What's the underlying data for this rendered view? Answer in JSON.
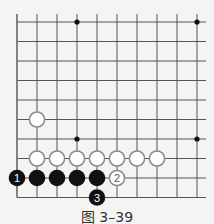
{
  "diagram": {
    "caption": "图 3–39",
    "grid": {
      "cols": 10,
      "rows": 10,
      "x0": 17,
      "dx": 20,
      "y0": 22,
      "dy": 19.5,
      "open_top": true,
      "open_right": true,
      "line_color": "#555555"
    },
    "star_points": [
      {
        "col": 3,
        "row": 0
      },
      {
        "col": 9,
        "row": 0
      },
      {
        "col": 3,
        "row": 6
      },
      {
        "col": 9,
        "row": 6
      }
    ],
    "stones": [
      {
        "color": "white",
        "col": 1,
        "row": 5,
        "label": ""
      },
      {
        "color": "white",
        "col": 1,
        "row": 7,
        "label": ""
      },
      {
        "color": "white",
        "col": 2,
        "row": 7,
        "label": ""
      },
      {
        "color": "white",
        "col": 3,
        "row": 7,
        "label": ""
      },
      {
        "color": "white",
        "col": 4,
        "row": 7,
        "label": ""
      },
      {
        "color": "white",
        "col": 5,
        "row": 7,
        "label": ""
      },
      {
        "color": "white",
        "col": 6,
        "row": 7,
        "label": ""
      },
      {
        "color": "white",
        "col": 7,
        "row": 7,
        "label": ""
      },
      {
        "color": "black",
        "col": 0,
        "row": 8,
        "label": "1"
      },
      {
        "color": "black",
        "col": 1,
        "row": 8,
        "label": ""
      },
      {
        "color": "black",
        "col": 2,
        "row": 8,
        "label": ""
      },
      {
        "color": "black",
        "col": 3,
        "row": 8,
        "label": ""
      },
      {
        "color": "black",
        "col": 4,
        "row": 8,
        "label": ""
      },
      {
        "color": "white",
        "col": 5,
        "row": 8,
        "label": "2"
      },
      {
        "color": "black",
        "col": 4,
        "row": 9,
        "label": "3"
      }
    ],
    "colors": {
      "black_stone": "#111111",
      "white_stone_fill": "#ffffff",
      "white_stone_stroke": "#8a8a8a",
      "label_on_black": "#ffffff",
      "label_on_white": "#555555"
    }
  }
}
